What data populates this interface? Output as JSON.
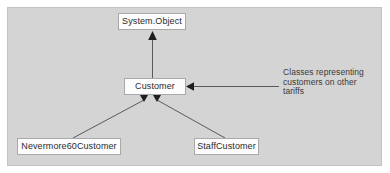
{
  "diagram": {
    "type": "uml-class-inheritance",
    "panel": {
      "background_color": "#d4d4d4",
      "border_color": "#c3c3c3"
    },
    "box_style": {
      "fill_color": "#fcfcfc",
      "border_color": "#a9a9a9",
      "text_color": "#2b2b2b"
    },
    "connector_color": "#5a5a5a",
    "classes": [
      {
        "id": "system-object",
        "label": "System.Object"
      },
      {
        "id": "customer",
        "label": "Customer"
      },
      {
        "id": "nevermore",
        "label": "Nevermore60Customer"
      },
      {
        "id": "staff",
        "label": "StaffCustomer"
      }
    ],
    "relations": [
      {
        "from": "customer",
        "to": "system-object",
        "kind": "inherits"
      },
      {
        "from": "nevermore",
        "to": "customer",
        "kind": "inherits"
      },
      {
        "from": "staff",
        "to": "customer",
        "kind": "inherits"
      }
    ],
    "annotation": {
      "target": "customer",
      "lines": [
        "Classes representing",
        "customers on other",
        "tariffs"
      ]
    }
  }
}
